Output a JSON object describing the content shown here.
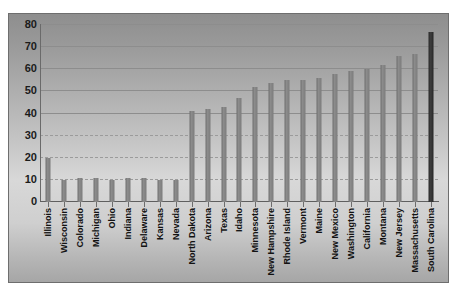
{
  "chart_data": {
    "type": "bar",
    "title": "",
    "xlabel": "",
    "ylabel": "",
    "ylim": [
      0,
      80
    ],
    "yticks": [
      0,
      10,
      20,
      30,
      40,
      50,
      60,
      70,
      80
    ],
    "grid": true,
    "legend": "none",
    "highlight_category": "South Carolina",
    "colors": {
      "bar": "#7e7e7e",
      "highlight_bar": "#2d2d2d",
      "plot_background": "#c8c8c8",
      "gridline": "#8d8d8d",
      "axis": "#6a6a6a",
      "label_text": "#121212"
    },
    "categories": [
      "Illinois",
      "Wisconsin",
      "Colorado",
      "Michigan",
      "Ohio",
      "Indiana",
      "Delaware",
      "Kansas",
      "Nevada",
      "North Dakota",
      "Arizona",
      "Texas",
      "Idaho",
      "Minnesota",
      "New Hampshire",
      "Rhode Island",
      "Vermont",
      "Maine",
      "New Mexico",
      "Washington",
      "California",
      "Montana",
      "New Jersey",
      "Massachusetts",
      "South Carolina"
    ],
    "values": [
      20,
      10,
      11,
      11,
      10,
      11,
      11,
      10,
      10,
      41,
      42,
      43,
      47,
      52,
      54,
      55,
      55,
      56,
      58,
      59,
      60,
      62,
      66,
      67,
      77
    ]
  }
}
